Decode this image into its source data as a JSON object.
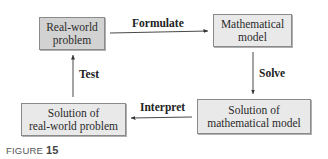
{
  "diagram": {
    "type": "cycle-flowchart",
    "nodes": [
      {
        "id": "real-world-problem",
        "line1": "Real-world",
        "line2": "problem"
      },
      {
        "id": "mathematical-model",
        "line1": "Mathematical",
        "line2": "model"
      },
      {
        "id": "solution-math-model",
        "line1": "Solution of",
        "line2": "mathematical model"
      },
      {
        "id": "solution-real-world",
        "line1": "Solution of",
        "line2": "real-world problem"
      }
    ],
    "edges": [
      {
        "from": "real-world-problem",
        "to": "mathematical-model",
        "label": "Formulate"
      },
      {
        "from": "mathematical-model",
        "to": "solution-math-model",
        "label": "Solve"
      },
      {
        "from": "solution-math-model",
        "to": "solution-real-world",
        "label": "Interpret"
      },
      {
        "from": "solution-real-world",
        "to": "real-world-problem",
        "label": "Test"
      }
    ]
  },
  "caption": {
    "prefix": "FIGURE",
    "number": "15"
  },
  "colors": {
    "box_dark": "#d2d2d2",
    "box_light": "#e9e9e9",
    "border": "#8a8a8a",
    "line": "#333333"
  }
}
